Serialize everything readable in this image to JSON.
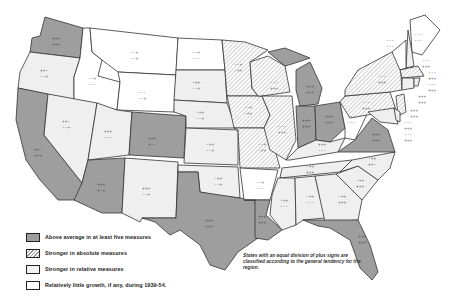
{
  "legend": {
    "items": [
      {
        "key": "above",
        "label": "Above average in at least five measures"
      },
      {
        "key": "absolute",
        "label": "Stronger in absolute measures"
      },
      {
        "key": "relative",
        "label": "Stronger in relative measures"
      },
      {
        "key": "little",
        "label": "Relatively little growth, if any, during 1939-54."
      }
    ]
  },
  "note": "States with an equal division of plus signs are classified according to the general tendency for the region.",
  "colors": {
    "above": "#9e9e9e",
    "absolute_hatch": "#999999",
    "relative_dots": "#f2f2f2",
    "little": "#ffffff",
    "border": "#333333"
  },
  "states": [
    {
      "name": "Washington",
      "category": "above",
      "signs": [
        "+++",
        "+++"
      ]
    },
    {
      "name": "Oregon",
      "category": "relative",
      "signs": [
        "++-",
        "--+"
      ]
    },
    {
      "name": "California",
      "category": "above",
      "signs": [
        "++-",
        "+++"
      ]
    },
    {
      "name": "Idaho",
      "category": "little",
      "signs": [
        "--+",
        "---"
      ]
    },
    {
      "name": "Nevada",
      "category": "relative",
      "signs": [
        "++-",
        "--+"
      ]
    },
    {
      "name": "Montana",
      "category": "little",
      "signs": [
        "--+",
        "--+"
      ]
    },
    {
      "name": "Wyoming",
      "category": "little",
      "signs": [
        "---",
        "--+"
      ]
    },
    {
      "name": "Utah",
      "category": "relative",
      "signs": [
        "+++",
        "---"
      ]
    },
    {
      "name": "Arizona",
      "category": "above",
      "signs": [
        "+++",
        "+-+"
      ]
    },
    {
      "name": "Colorado",
      "category": "above",
      "signs": [
        "+++",
        "+--"
      ]
    },
    {
      "name": "New Mexico",
      "category": "relative",
      "signs": [
        "+++",
        "--+"
      ]
    },
    {
      "name": "North Dakota",
      "category": "little",
      "signs": [
        "--+",
        "---"
      ]
    },
    {
      "name": "South Dakota",
      "category": "relative",
      "signs": [
        "-++",
        "--+"
      ]
    },
    {
      "name": "Nebraska",
      "category": "relative",
      "signs": [
        "-++",
        "--+"
      ]
    },
    {
      "name": "Kansas",
      "category": "relative",
      "signs": [
        "-++",
        "--+"
      ]
    },
    {
      "name": "Oklahoma",
      "category": "relative",
      "signs": [
        "-++",
        "--+"
      ]
    },
    {
      "name": "Texas",
      "category": "above",
      "signs": [
        "+++",
        "+++"
      ]
    },
    {
      "name": "Minnesota",
      "category": "absolute",
      "signs": [
        "--+",
        "-++"
      ]
    },
    {
      "name": "Iowa",
      "category": "absolute",
      "signs": [
        "--+",
        "-++"
      ]
    },
    {
      "name": "Missouri",
      "category": "absolute",
      "signs": [
        "--+",
        "-++"
      ]
    },
    {
      "name": "Arkansas",
      "category": "little",
      "signs": [
        "--+",
        "---"
      ]
    },
    {
      "name": "Louisiana",
      "category": "above",
      "signs": [
        "+++",
        "+++"
      ]
    },
    {
      "name": "Wisconsin",
      "category": "absolute",
      "signs": [
        "---",
        "+++"
      ]
    },
    {
      "name": "Illinois",
      "category": "absolute",
      "signs": [
        "---",
        "+++"
      ]
    },
    {
      "name": "Michigan",
      "category": "above",
      "signs": [
        "+++",
        "+++"
      ]
    },
    {
      "name": "Indiana",
      "category": "above",
      "signs": [
        "+++",
        "+++"
      ]
    },
    {
      "name": "Ohio",
      "category": "above",
      "signs": [
        "+++",
        "+++"
      ]
    },
    {
      "name": "Kentucky",
      "category": "relative",
      "signs": [
        "+++",
        "---"
      ]
    },
    {
      "name": "Tennessee",
      "category": "relative",
      "signs": [
        "-++",
        "+++"
      ]
    },
    {
      "name": "Mississippi",
      "category": "relative",
      "signs": [
        "-++",
        "---"
      ]
    },
    {
      "name": "Alabama",
      "category": "relative",
      "signs": [
        "-++",
        "---"
      ]
    },
    {
      "name": "Georgia",
      "category": "relative",
      "signs": [
        "-++",
        "+++"
      ]
    },
    {
      "name": "Florida",
      "category": "above",
      "signs": [
        "+++",
        "+++"
      ]
    },
    {
      "name": "South Carolina",
      "category": "relative",
      "signs": [
        "-++",
        "+++"
      ]
    },
    {
      "name": "North Carolina",
      "category": "relative",
      "signs": [
        "-++",
        "++-"
      ]
    },
    {
      "name": "Virginia",
      "category": "above",
      "signs": [
        "+++",
        "+++"
      ]
    },
    {
      "name": "West Virginia",
      "category": "little",
      "signs": [
        "---",
        "---"
      ]
    },
    {
      "name": "Pennsylvania",
      "category": "absolute",
      "signs": [
        "---",
        "+++"
      ]
    },
    {
      "name": "New York",
      "category": "absolute",
      "signs": [
        "---",
        "+++"
      ]
    },
    {
      "name": "Maine",
      "category": "little",
      "signs": [
        "---",
        "---"
      ]
    },
    {
      "name": "New Hampshire",
      "category": "relative",
      "signs": [
        "---",
        "+++"
      ]
    },
    {
      "name": "Vermont",
      "category": "little",
      "signs": [
        "---",
        "---"
      ]
    },
    {
      "name": "Massachusetts",
      "category": "absolute",
      "signs": [
        "---",
        "+++"
      ]
    },
    {
      "name": "Rhode Island",
      "category": "relative",
      "signs": [
        "---",
        "+++"
      ]
    },
    {
      "name": "Connecticut",
      "category": "relative",
      "signs": [
        "+++",
        "+++"
      ]
    },
    {
      "name": "New Jersey",
      "category": "absolute",
      "signs": [
        "+++",
        "+++"
      ]
    },
    {
      "name": "Delaware",
      "category": "relative",
      "signs": [
        "---",
        "+++"
      ]
    },
    {
      "name": "Maryland",
      "category": "relative",
      "signs": [
        "---",
        "+++"
      ]
    }
  ]
}
